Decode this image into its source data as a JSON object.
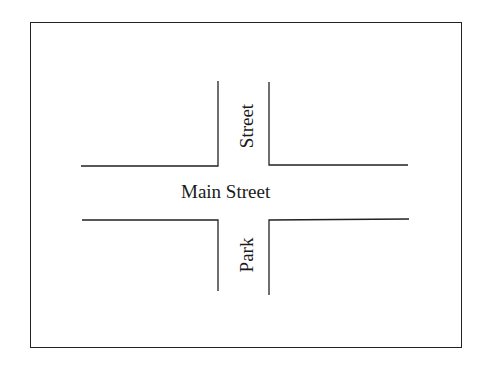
{
  "diagram": {
    "type": "street-intersection-map",
    "streets": [
      {
        "name": "Main Street",
        "orientation": "horizontal"
      },
      {
        "name": "Street",
        "orientation": "vertical",
        "position": "north"
      },
      {
        "name": "Park",
        "orientation": "vertical",
        "position": "south"
      }
    ],
    "labels": {
      "main_street": "Main Street",
      "north_street": "Street",
      "south_street": "Park"
    },
    "colors": {
      "line": "#222222",
      "background": "#ffffff"
    }
  }
}
